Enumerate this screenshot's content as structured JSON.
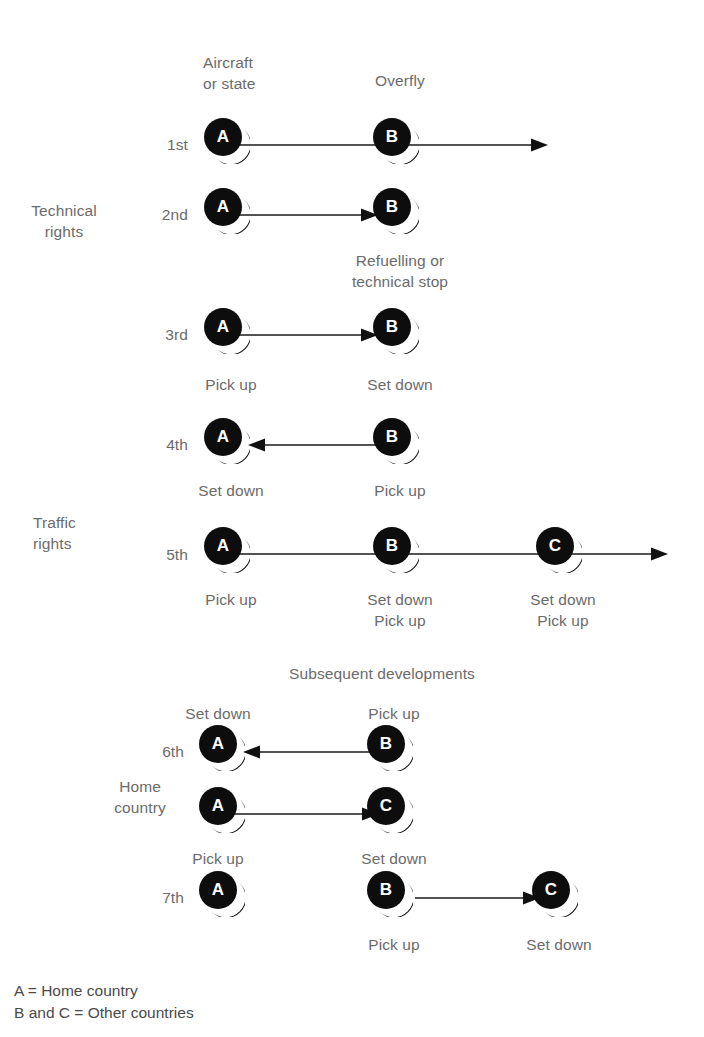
{
  "diagram": {
    "title_subsequent": "Subsequent developments",
    "column_headers": [
      {
        "id": "aircraft-or-state",
        "text": "Aircraft\nor state"
      },
      {
        "id": "overfly",
        "text": "Overfly"
      }
    ],
    "group_labels": [
      {
        "id": "technical-rights",
        "text": "Technical\nrights"
      },
      {
        "id": "traffic-rights",
        "text": "Traffic\nrights"
      },
      {
        "id": "home-country",
        "text": "Home\ncountry"
      }
    ],
    "ordinals": [
      {
        "id": "first",
        "text": "1st"
      },
      {
        "id": "second",
        "text": "2nd"
      },
      {
        "id": "third",
        "text": "3rd"
      },
      {
        "id": "fourth",
        "text": "4th"
      },
      {
        "id": "fifth",
        "text": "5th"
      },
      {
        "id": "sixth",
        "text": "6th"
      },
      {
        "id": "seventh",
        "text": "7th"
      }
    ],
    "nodes": [
      {
        "id": "n1a",
        "letter": "A"
      },
      {
        "id": "n1b",
        "letter": "B"
      },
      {
        "id": "n2a",
        "letter": "A"
      },
      {
        "id": "n2b",
        "letter": "B"
      },
      {
        "id": "n3a",
        "letter": "A"
      },
      {
        "id": "n3b",
        "letter": "B"
      },
      {
        "id": "n4a",
        "letter": "A"
      },
      {
        "id": "n4b",
        "letter": "B"
      },
      {
        "id": "n5a",
        "letter": "A"
      },
      {
        "id": "n5b",
        "letter": "B"
      },
      {
        "id": "n5c",
        "letter": "C"
      },
      {
        "id": "n6a",
        "letter": "A"
      },
      {
        "id": "n6b",
        "letter": "B"
      },
      {
        "id": "n6a2",
        "letter": "A"
      },
      {
        "id": "n6c",
        "letter": "C"
      },
      {
        "id": "n7a",
        "letter": "A"
      },
      {
        "id": "n7b",
        "letter": "B"
      },
      {
        "id": "n7c",
        "letter": "C"
      }
    ],
    "annotations": [
      {
        "id": "refuelling-or-technical-stop",
        "text": "Refuelling or\ntechnical stop"
      },
      {
        "id": "third-pick-up",
        "text": "Pick up"
      },
      {
        "id": "third-set-down",
        "text": "Set down"
      },
      {
        "id": "fourth-set-down",
        "text": "Set down"
      },
      {
        "id": "fourth-pick-up",
        "text": "Pick up"
      },
      {
        "id": "fifth-pick-up",
        "text": "Pick up"
      },
      {
        "id": "fifth-set-down-pick-up-b",
        "text": "Set down\nPick up"
      },
      {
        "id": "fifth-set-down-pick-up-c",
        "text": "Set down\nPick up"
      },
      {
        "id": "sixth-set-down",
        "text": "Set down"
      },
      {
        "id": "sixth-pick-up",
        "text": "Pick up"
      },
      {
        "id": "sixth-pick-up-lower",
        "text": "Pick up"
      },
      {
        "id": "sixth-set-down-lower",
        "text": "Set down"
      },
      {
        "id": "seventh-pick-up",
        "text": "Pick up"
      },
      {
        "id": "seventh-set-down",
        "text": "Set down"
      }
    ],
    "legend": [
      {
        "id": "legend-a",
        "text": "A = Home country"
      },
      {
        "id": "legend-bc",
        "text": "B and C = Other countries"
      }
    ],
    "colors": {
      "node_fill": "#0d0d0d",
      "node_letter": "#ffffff",
      "arrow": "#1a1a1a",
      "label_text": "#6b6b6b",
      "legend_text": "#4a4a4a",
      "background": "#ffffff"
    }
  }
}
